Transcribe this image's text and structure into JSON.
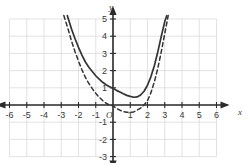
{
  "chart_data": {
    "type": "line",
    "title": "",
    "subtitle": "",
    "xlabel": "x",
    "ylabel": "y",
    "xlim": [
      -6,
      6
    ],
    "ylim": [
      -3,
      5
    ],
    "grid": true,
    "grid_step": 1,
    "legend": "none",
    "origin_label": "O",
    "xticks": [
      -6,
      -5,
      -4,
      -3,
      -2,
      -1,
      1,
      2,
      3,
      4,
      5,
      6
    ],
    "xtick_labels": [
      "-6",
      "-5",
      "-4",
      "-3",
      "-2",
      "-1",
      "1",
      "2",
      "3",
      "4",
      "5",
      "6"
    ],
    "yticks": [
      5,
      4,
      3,
      2,
      1,
      -1,
      -2,
      -3
    ],
    "ytick_labels": [
      "5",
      "4",
      "3",
      "2",
      "1",
      "-1",
      "-2",
      "-3"
    ],
    "series": [
      {
        "name": "solid-parabola",
        "style": "solid",
        "color": "#333333",
        "vertex": [
          1.15,
          0.45
        ],
        "x": [
          -2.65,
          -2.4,
          -2.2,
          -2.0,
          -1.8,
          -1.6,
          -1.4,
          -1.2,
          -1.0,
          -0.8,
          -0.6,
          -0.4,
          -0.2,
          0.0,
          0.2,
          0.4,
          0.6,
          0.8,
          1.0,
          1.2,
          1.4,
          1.6,
          1.8,
          2.0,
          2.2,
          2.4,
          2.6,
          2.8,
          3.0,
          3.12
        ],
        "y": [
          5.2,
          4.4,
          3.85,
          3.35,
          2.9,
          2.5,
          2.2,
          1.95,
          1.7,
          1.5,
          1.32,
          1.18,
          1.06,
          0.97,
          0.85,
          0.75,
          0.65,
          0.56,
          0.5,
          0.45,
          0.47,
          0.58,
          0.8,
          1.15,
          1.65,
          2.3,
          3.1,
          4.0,
          4.85,
          5.2
        ]
      },
      {
        "name": "dashed-parabola",
        "style": "dashed",
        "color": "#333333",
        "vertex": [
          1.0,
          -0.42
        ],
        "roots": [
          0,
          2
        ],
        "x": [
          -2.85,
          -2.6,
          -2.4,
          -2.2,
          -2.0,
          -1.8,
          -1.6,
          -1.4,
          -1.2,
          -1.0,
          -0.8,
          -0.6,
          -0.4,
          -0.2,
          0.0,
          0.2,
          0.4,
          0.6,
          0.8,
          1.0,
          1.2,
          1.4,
          1.6,
          1.8,
          2.0,
          2.2,
          2.4,
          2.6,
          2.8,
          3.0,
          3.2
        ],
        "y": [
          5.2,
          4.4,
          3.7,
          3.1,
          2.55,
          2.05,
          1.6,
          1.25,
          0.95,
          0.68,
          0.45,
          0.26,
          0.1,
          0.0,
          -0.05,
          -0.2,
          -0.3,
          -0.38,
          -0.42,
          -0.42,
          -0.4,
          -0.3,
          -0.18,
          0.0,
          0.25,
          0.72,
          1.35,
          2.15,
          3.1,
          4.15,
          5.2
        ]
      }
    ]
  }
}
